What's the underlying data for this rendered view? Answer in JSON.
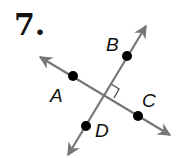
{
  "problem": {
    "number": "7."
  },
  "colors": {
    "line": "#777777",
    "point": "#000000",
    "label": "#111111"
  },
  "lines": [
    {
      "name": "line-AC",
      "from": [
        40,
        57
      ],
      "to": [
        170,
        135
      ]
    },
    {
      "name": "line-BD",
      "from": [
        146,
        26
      ],
      "to": [
        68,
        155
      ]
    }
  ],
  "points": [
    {
      "label": "A",
      "x": 73,
      "y": 76,
      "label_x": 50,
      "label_y": 102
    },
    {
      "label": "B",
      "x": 127,
      "y": 56,
      "label_x": 106,
      "label_y": 51
    },
    {
      "label": "C",
      "x": 138,
      "y": 116,
      "label_x": 142,
      "label_y": 107
    },
    {
      "label": "D",
      "x": 86,
      "y": 126,
      "label_x": 95,
      "label_y": 137
    }
  ],
  "right_angle_marker": {
    "at_intersection": [
      104,
      96
    ]
  }
}
